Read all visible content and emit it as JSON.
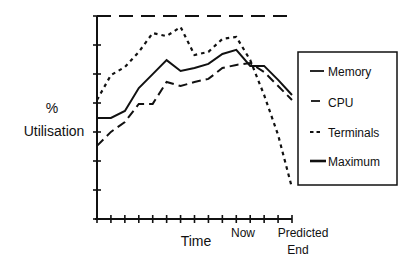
{
  "chart_data": {
    "type": "line",
    "title": "",
    "xlabel": "Time",
    "ylabel": "% Utilisation",
    "ylabel_lines": [
      "%",
      "Utilisation"
    ],
    "ylim": [
      0,
      100
    ],
    "y_ticks_count": 8,
    "x_points": 15,
    "x_tick_labels": [
      {
        "index": 10,
        "label": "Now"
      },
      {
        "index": 14,
        "label": "Predicted End"
      }
    ],
    "grid": false,
    "legend_position": "right",
    "series": [
      {
        "name": "Memory",
        "style": "solid",
        "values": [
          49.8,
          49.8,
          53.2,
          64.5,
          71.4,
          78.3,
          72.9,
          74.4,
          76.4,
          81.3,
          83.3,
          75.4,
          75.4,
          68.5,
          61.1
        ]
      },
      {
        "name": "CPU",
        "style": "long-dash",
        "values": [
          36.0,
          42.9,
          47.8,
          56.7,
          56.7,
          67.5,
          65.5,
          67.5,
          69.0,
          74.4,
          75.9,
          76.8,
          72.4,
          65.5,
          58.6
        ]
      },
      {
        "name": "Terminals",
        "style": "dotted",
        "values": [
          58.6,
          70.9,
          74.9,
          82.3,
          91.6,
          90.1,
          94.6,
          80.8,
          82.3,
          88.7,
          89.7,
          78.3,
          61.1,
          41.4,
          15.3
        ]
      },
      {
        "name": "Maximum",
        "style": "dashed-thick",
        "values": [
          100,
          100,
          100,
          100,
          100,
          100,
          100,
          100,
          100,
          100,
          100,
          100,
          100,
          100,
          100
        ]
      }
    ]
  },
  "labels": {
    "y_percent": "%",
    "y_utilisation": "Utilisation",
    "x_time": "Time",
    "x_now": "Now",
    "x_predicted": "Predicted",
    "x_end": "End"
  },
  "legend": {
    "items": [
      {
        "label": "Memory"
      },
      {
        "label": "CPU"
      },
      {
        "label": "Terminals"
      },
      {
        "label": "Maximum"
      }
    ]
  },
  "colors": {
    "ink": "#111111",
    "background": "#ffffff"
  }
}
